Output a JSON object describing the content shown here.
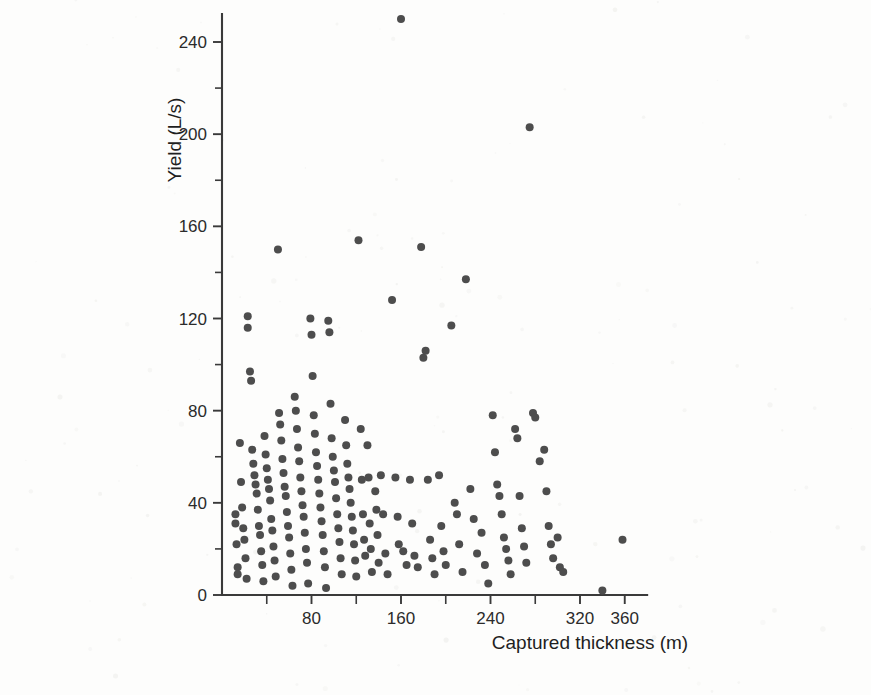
{
  "figure": {
    "background_color": "#fdfdfc",
    "marker_color": "#4d4d4d",
    "axis_color": "#3a3a3a",
    "text_color": "#2b2b2b"
  },
  "chart_data": {
    "type": "scatter",
    "title": "",
    "xlabel": "Captured thickness (m)",
    "ylabel": "Yield (L/s)",
    "xlim": [
      0,
      380
    ],
    "ylim": [
      0,
      252
    ],
    "grid": false,
    "legend": null,
    "x_ticks_major": [
      80,
      160,
      240,
      320,
      360
    ],
    "x_tick_labels": [
      "80",
      "160",
      "240",
      "320",
      "360"
    ],
    "x_ticks_minor": [
      40,
      120,
      200,
      280
    ],
    "y_ticks_major": [
      0,
      40,
      80,
      120,
      160,
      200,
      240
    ],
    "y_tick_labels": [
      "0",
      "40",
      "80",
      "120",
      "160",
      "200",
      "240"
    ],
    "y_ticks_minor": [
      20,
      60,
      100,
      140,
      180,
      220
    ],
    "marker": "circle",
    "marker_size": 8,
    "n_points": 186,
    "points": [
      [
        12,
        35
      ],
      [
        12,
        31
      ],
      [
        13,
        22
      ],
      [
        14,
        12
      ],
      [
        14,
        9
      ],
      [
        16,
        66
      ],
      [
        17,
        49
      ],
      [
        18,
        38
      ],
      [
        19,
        29
      ],
      [
        20,
        24
      ],
      [
        21,
        16
      ],
      [
        22,
        7
      ],
      [
        23,
        121
      ],
      [
        23,
        116
      ],
      [
        25,
        97
      ],
      [
        26,
        93
      ],
      [
        27,
        63
      ],
      [
        28,
        57
      ],
      [
        29,
        52
      ],
      [
        30,
        48
      ],
      [
        31,
        44
      ],
      [
        32,
        37
      ],
      [
        33,
        30
      ],
      [
        34,
        26
      ],
      [
        35,
        19
      ],
      [
        36,
        13
      ],
      [
        37,
        6
      ],
      [
        38,
        69
      ],
      [
        39,
        61
      ],
      [
        40,
        55
      ],
      [
        41,
        50
      ],
      [
        42,
        46
      ],
      [
        43,
        41
      ],
      [
        44,
        33
      ],
      [
        45,
        28
      ],
      [
        46,
        21
      ],
      [
        47,
        15
      ],
      [
        48,
        8
      ],
      [
        50,
        150
      ],
      [
        51,
        79
      ],
      [
        52,
        74
      ],
      [
        53,
        67
      ],
      [
        54,
        59
      ],
      [
        55,
        53
      ],
      [
        56,
        47
      ],
      [
        57,
        43
      ],
      [
        58,
        36
      ],
      [
        59,
        30
      ],
      [
        60,
        25
      ],
      [
        61,
        18
      ],
      [
        62,
        11
      ],
      [
        63,
        4
      ],
      [
        65,
        86
      ],
      [
        66,
        80
      ],
      [
        67,
        72
      ],
      [
        68,
        64
      ],
      [
        69,
        58
      ],
      [
        70,
        51
      ],
      [
        71,
        45
      ],
      [
        72,
        39
      ],
      [
        73,
        34
      ],
      [
        74,
        27
      ],
      [
        75,
        20
      ],
      [
        76,
        14
      ],
      [
        77,
        5
      ],
      [
        79,
        120
      ],
      [
        80,
        113
      ],
      [
        81,
        95
      ],
      [
        82,
        78
      ],
      [
        83,
        70
      ],
      [
        84,
        62
      ],
      [
        85,
        56
      ],
      [
        86,
        50
      ],
      [
        87,
        44
      ],
      [
        88,
        38
      ],
      [
        89,
        32
      ],
      [
        90,
        26
      ],
      [
        91,
        19
      ],
      [
        92,
        12
      ],
      [
        93,
        3
      ],
      [
        95,
        119
      ],
      [
        96,
        114
      ],
      [
        97,
        83
      ],
      [
        98,
        68
      ],
      [
        99,
        60
      ],
      [
        100,
        54
      ],
      [
        101,
        49
      ],
      [
        102,
        42
      ],
      [
        103,
        35
      ],
      [
        104,
        29
      ],
      [
        105,
        23
      ],
      [
        106,
        16
      ],
      [
        107,
        9
      ],
      [
        110,
        76
      ],
      [
        111,
        65
      ],
      [
        112,
        57
      ],
      [
        113,
        51
      ],
      [
        114,
        46
      ],
      [
        115,
        40
      ],
      [
        116,
        34
      ],
      [
        117,
        28
      ],
      [
        118,
        22
      ],
      [
        119,
        15
      ],
      [
        120,
        8
      ],
      [
        122,
        154
      ],
      [
        124,
        72
      ],
      [
        125,
        50
      ],
      [
        126,
        35
      ],
      [
        127,
        24
      ],
      [
        128,
        17
      ],
      [
        130,
        65
      ],
      [
        131,
        51
      ],
      [
        132,
        31
      ],
      [
        133,
        20
      ],
      [
        134,
        10
      ],
      [
        137,
        45
      ],
      [
        138,
        37
      ],
      [
        139,
        26
      ],
      [
        140,
        14
      ],
      [
        142,
        52
      ],
      [
        144,
        35
      ],
      [
        146,
        18
      ],
      [
        148,
        9
      ],
      [
        152,
        128
      ],
      [
        155,
        51
      ],
      [
        157,
        34
      ],
      [
        158,
        22
      ],
      [
        160,
        250
      ],
      [
        162,
        19
      ],
      [
        165,
        13
      ],
      [
        168,
        50
      ],
      [
        170,
        31
      ],
      [
        172,
        17
      ],
      [
        175,
        12
      ],
      [
        178,
        151
      ],
      [
        180,
        103
      ],
      [
        182,
        106
      ],
      [
        184,
        50
      ],
      [
        186,
        24
      ],
      [
        188,
        16
      ],
      [
        190,
        9
      ],
      [
        194,
        52
      ],
      [
        196,
        30
      ],
      [
        198,
        19
      ],
      [
        200,
        13
      ],
      [
        205,
        117
      ],
      [
        208,
        40
      ],
      [
        210,
        35
      ],
      [
        212,
        22
      ],
      [
        215,
        10
      ],
      [
        218,
        137
      ],
      [
        222,
        46
      ],
      [
        225,
        33
      ],
      [
        228,
        18
      ],
      [
        232,
        27
      ],
      [
        235,
        13
      ],
      [
        238,
        5
      ],
      [
        242,
        78
      ],
      [
        244,
        62
      ],
      [
        246,
        48
      ],
      [
        248,
        43
      ],
      [
        250,
        35
      ],
      [
        252,
        25
      ],
      [
        254,
        20
      ],
      [
        256,
        15
      ],
      [
        258,
        9
      ],
      [
        262,
        72
      ],
      [
        264,
        68
      ],
      [
        266,
        43
      ],
      [
        268,
        29
      ],
      [
        270,
        21
      ],
      [
        272,
        14
      ],
      [
        275,
        203
      ],
      [
        278,
        79
      ],
      [
        280,
        77
      ],
      [
        284,
        58
      ],
      [
        288,
        63
      ],
      [
        290,
        45
      ],
      [
        292,
        30
      ],
      [
        294,
        22
      ],
      [
        296,
        16
      ],
      [
        300,
        25
      ],
      [
        302,
        12
      ],
      [
        305,
        10
      ],
      [
        340,
        2
      ],
      [
        358,
        24
      ]
    ]
  },
  "axis_labels": {
    "x_title": "Captured thickness (m)",
    "y_title": "Yield (L/s)"
  }
}
